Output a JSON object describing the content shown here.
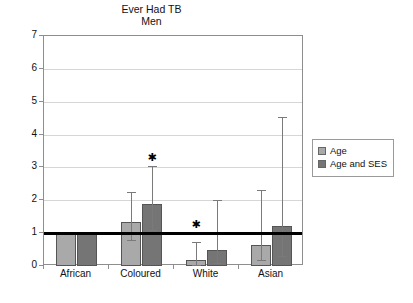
{
  "chart_data": {
    "type": "bar",
    "title": "Ever Had TB",
    "subtitle": "Men",
    "xlabel": "",
    "ylabel": "Odds Ratio",
    "ylim": [
      0,
      7
    ],
    "yticks": [
      0,
      1,
      2,
      3,
      4,
      5,
      6,
      7
    ],
    "grid": true,
    "legend_position": "right",
    "reference_line": 1,
    "categories": [
      "African",
      "Coloured",
      "White",
      "Asian"
    ],
    "series": [
      {
        "name": "Age",
        "color": "#a9a9a9",
        "values": [
          1.0,
          1.35,
          0.18,
          0.63
        ],
        "ci_low": [
          1.0,
          0.78,
          0.03,
          0.17
        ],
        "ci_high": [
          1.0,
          2.25,
          0.72,
          2.3
        ],
        "significant": [
          false,
          false,
          true,
          false
        ]
      },
      {
        "name": "Age and SES",
        "color": "#757575",
        "values": [
          1.0,
          1.9,
          0.48,
          1.22
        ],
        "ci_low": [
          1.0,
          1.1,
          0.1,
          0.3
        ],
        "ci_high": [
          1.0,
          3.05,
          2.0,
          4.55
        ],
        "significant": [
          false,
          true,
          false,
          false
        ]
      }
    ],
    "annotations": [
      {
        "label": "*",
        "category": "Coloured",
        "series": "Age and SES",
        "value": 3.15
      },
      {
        "label": "*",
        "category": "White",
        "series": "Age",
        "value": 1.1
      }
    ]
  },
  "legend": {
    "items": [
      {
        "label": "Age",
        "swatch": "light"
      },
      {
        "label": "Age and SES",
        "swatch": "dark"
      }
    ]
  },
  "axis": {
    "y_title": "Odds Ratio",
    "y_tick_labels": [
      "7",
      "6",
      "5",
      "4",
      "3",
      "2",
      "1",
      "0"
    ],
    "x_tick_labels": [
      "African",
      "Coloured",
      "White",
      "Asian"
    ]
  },
  "title": {
    "line1": "Ever Had TB",
    "line2": "Men"
  },
  "star_glyph": "✱"
}
